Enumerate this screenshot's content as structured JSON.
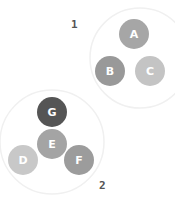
{
  "groups": [
    {
      "label": "1",
      "label_pos": [
        71,
        18
      ],
      "halo": {
        "cx": 140,
        "cy": 58,
        "r": 50
      }
    },
    {
      "label": "2",
      "label_pos": [
        99,
        179
      ],
      "halo": {
        "cx": 52,
        "cy": 142,
        "r": 52
      }
    }
  ],
  "nodes": [
    {
      "id": "A",
      "cx": 134,
      "cy": 34,
      "r": 15,
      "color": "#a6a6a6"
    },
    {
      "id": "B",
      "cx": 110,
      "cy": 71,
      "r": 15,
      "color": "#999999"
    },
    {
      "id": "C",
      "cx": 150,
      "cy": 71,
      "r": 15,
      "color": "#c4c4c4"
    },
    {
      "id": "G",
      "cx": 52,
      "cy": 112,
      "r": 15,
      "color": "#555555"
    },
    {
      "id": "E",
      "cx": 52,
      "cy": 144,
      "r": 15,
      "color": "#a4a4a4"
    },
    {
      "id": "D",
      "cx": 23,
      "cy": 160,
      "r": 15,
      "color": "#c8c8c8"
    },
    {
      "id": "F",
      "cx": 79,
      "cy": 160,
      "r": 15,
      "color": "#9c9c9c"
    }
  ]
}
